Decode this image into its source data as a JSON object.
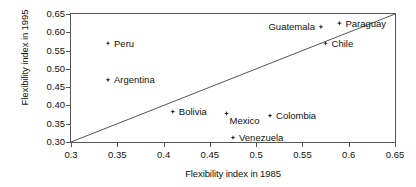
{
  "chart_data": {
    "type": "scatter",
    "title": "",
    "xlabel": "Flexibility index in 1985",
    "ylabel": "Flexibility index in 1995",
    "xlim": [
      0.3,
      0.65
    ],
    "ylim": [
      0.3,
      0.65
    ],
    "grid": false,
    "legend": "none",
    "xticks": [
      "0.3",
      "0.35",
      "0.4",
      "0.45",
      "0.5",
      "0.55",
      "0.6",
      "0.65"
    ],
    "xtick_values": [
      0.3,
      0.35,
      0.4,
      0.45,
      0.5,
      0.55,
      0.6,
      0.65
    ],
    "yticks": [
      "0.30",
      "0.35",
      "0.40",
      "0.45",
      "0.50",
      "0.55",
      "0.60",
      "0.65"
    ],
    "ytick_values": [
      0.3,
      0.35,
      0.4,
      0.45,
      0.5,
      0.55,
      0.6,
      0.65
    ],
    "annotations": [
      {
        "type": "line",
        "name": "45-degree-reference-line",
        "from": [
          0.3,
          0.3
        ],
        "to": [
          0.65,
          0.65
        ]
      }
    ],
    "points": [
      {
        "label": "Peru",
        "x": 0.34,
        "y": 0.57,
        "label_pos": "right"
      },
      {
        "label": "Argentina",
        "x": 0.34,
        "y": 0.47,
        "label_pos": "right"
      },
      {
        "label": "Guatemala",
        "x": 0.57,
        "y": 0.615,
        "label_pos": "left"
      },
      {
        "label": "Paraguay",
        "x": 0.59,
        "y": 0.625,
        "label_pos": "right"
      },
      {
        "label": "Chile",
        "x": 0.575,
        "y": 0.57,
        "label_pos": "right"
      },
      {
        "label": "Bolivia",
        "x": 0.41,
        "y": 0.383,
        "label_pos": "right"
      },
      {
        "label": "Mexico",
        "x": 0.468,
        "y": 0.378,
        "label_pos": "below-right"
      },
      {
        "label": "Colombia",
        "x": 0.515,
        "y": 0.372,
        "label_pos": "right"
      },
      {
        "label": "Venezuela",
        "x": 0.475,
        "y": 0.312,
        "label_pos": "right"
      }
    ],
    "colors": {
      "marker": "#1a1a1a",
      "axis": "#555555",
      "text": "#111111",
      "background": "#ffffff"
    }
  }
}
